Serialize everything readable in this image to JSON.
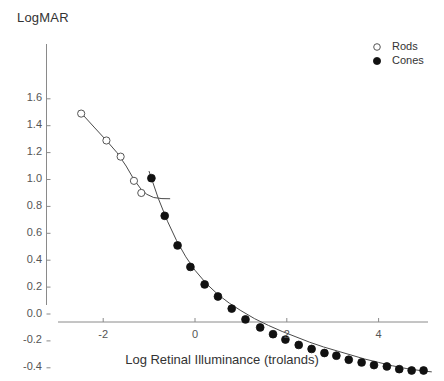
{
  "chart_data": {
    "type": "scatter",
    "title": "",
    "ylabel": "LogMAR",
    "xlabel": "Log Retinal Illuminance (trolands)",
    "xlim": [
      -2.85,
      5.25
    ],
    "ylim": [
      -0.52,
      1.62
    ],
    "grid": false,
    "legend_position": "top-right",
    "xticks": [
      -2,
      0,
      2,
      4
    ],
    "xticklabels": [
      "-2",
      "0",
      "2",
      "4"
    ],
    "yticks": [
      1.6,
      1.4,
      1.2,
      1.0,
      0.8,
      0.6,
      0.4,
      0.2,
      0.0,
      -0.2,
      -0.4
    ],
    "yticklabels": [
      "1.6",
      "1.4",
      "1.2",
      "1.0",
      "0.8",
      "0.6",
      "0.4",
      "0.2",
      "0.0",
      "-0.2",
      "-0.4"
    ],
    "series": [
      {
        "name": "Rods",
        "marker": "open-circle",
        "color": "#222222",
        "points": [
          {
            "x": -2.48,
            "y": 1.49
          },
          {
            "x": -1.93,
            "y": 1.29
          },
          {
            "x": -1.62,
            "y": 1.17
          },
          {
            "x": -1.33,
            "y": 0.99
          },
          {
            "x": -1.17,
            "y": 0.9
          }
        ],
        "fit_curve": [
          {
            "x": -2.52,
            "y": 1.51
          },
          {
            "x": -2.2,
            "y": 1.39
          },
          {
            "x": -1.93,
            "y": 1.29
          },
          {
            "x": -1.7,
            "y": 1.2
          },
          {
            "x": -1.5,
            "y": 1.1
          },
          {
            "x": -1.33,
            "y": 1.0
          },
          {
            "x": -1.18,
            "y": 0.93
          },
          {
            "x": -1.05,
            "y": 0.89
          },
          {
            "x": -0.9,
            "y": 0.866
          },
          {
            "x": -0.72,
            "y": 0.858
          },
          {
            "x": -0.55,
            "y": 0.857
          }
        ]
      },
      {
        "name": "Cones",
        "marker": "filled-circle",
        "color": "#111111",
        "points": [
          {
            "x": -0.95,
            "y": 1.01
          },
          {
            "x": -0.66,
            "y": 0.73
          },
          {
            "x": -0.38,
            "y": 0.51
          },
          {
            "x": -0.1,
            "y": 0.35
          },
          {
            "x": 0.21,
            "y": 0.22
          },
          {
            "x": 0.5,
            "y": 0.13
          },
          {
            "x": 0.8,
            "y": 0.04
          },
          {
            "x": 1.1,
            "y": -0.04
          },
          {
            "x": 1.42,
            "y": -0.1
          },
          {
            "x": 1.7,
            "y": -0.15
          },
          {
            "x": 1.97,
            "y": -0.19
          },
          {
            "x": 2.26,
            "y": -0.23
          },
          {
            "x": 2.54,
            "y": -0.26
          },
          {
            "x": 2.82,
            "y": -0.29
          },
          {
            "x": 3.08,
            "y": -0.31
          },
          {
            "x": 3.35,
            "y": -0.34
          },
          {
            "x": 3.63,
            "y": -0.36
          },
          {
            "x": 3.9,
            "y": -0.38
          },
          {
            "x": 4.18,
            "y": -0.39
          },
          {
            "x": 4.45,
            "y": -0.41
          },
          {
            "x": 4.72,
            "y": -0.42
          },
          {
            "x": 4.98,
            "y": -0.42
          }
        ],
        "fit_curve": [
          {
            "x": -1.0,
            "y": 1.06
          },
          {
            "x": -0.8,
            "y": 0.86
          },
          {
            "x": -0.6,
            "y": 0.69
          },
          {
            "x": -0.4,
            "y": 0.545
          },
          {
            "x": -0.2,
            "y": 0.425
          },
          {
            "x": 0.0,
            "y": 0.325
          },
          {
            "x": 0.25,
            "y": 0.225
          },
          {
            "x": 0.5,
            "y": 0.145
          },
          {
            "x": 0.75,
            "y": 0.08
          },
          {
            "x": 1.0,
            "y": 0.025
          },
          {
            "x": 1.3,
            "y": -0.035
          },
          {
            "x": 1.6,
            "y": -0.085
          },
          {
            "x": 1.9,
            "y": -0.13
          },
          {
            "x": 2.2,
            "y": -0.17
          },
          {
            "x": 2.5,
            "y": -0.21
          },
          {
            "x": 2.8,
            "y": -0.245
          },
          {
            "x": 3.1,
            "y": -0.275
          },
          {
            "x": 3.4,
            "y": -0.305
          },
          {
            "x": 3.7,
            "y": -0.335
          },
          {
            "x": 4.0,
            "y": -0.36
          },
          {
            "x": 4.3,
            "y": -0.385
          },
          {
            "x": 4.6,
            "y": -0.405
          },
          {
            "x": 5.0,
            "y": -0.425
          },
          {
            "x": 5.15,
            "y": -0.43
          }
        ]
      }
    ]
  },
  "legend": {
    "entries": [
      {
        "label": "Rods",
        "marker": "open-circle"
      },
      {
        "label": "Cones",
        "marker": "filled-circle"
      }
    ]
  }
}
